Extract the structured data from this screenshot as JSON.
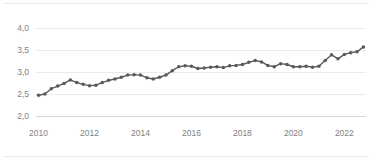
{
  "chart_data": {
    "type": "line",
    "title": "",
    "subtitle": "",
    "xlabel": "",
    "ylabel": "",
    "xlim": [
      2009.9,
      2022.85
    ],
    "ylim": [
      2.0,
      4.0
    ],
    "grid": true,
    "legend": false,
    "legend_position": "none",
    "decimal_separator": ",",
    "marker": "circle",
    "line_color": "#58595b",
    "marker_color": "#58595b",
    "gridline_color": "#e9eaeb",
    "axis_color": "#d8d9da",
    "tick_label_color": "#808285",
    "background_color": "#ffffff",
    "y_ticks": [
      2.0,
      2.5,
      3.0,
      3.5,
      4.0
    ],
    "y_tick_labels": [
      "2,0",
      "2,5",
      "3,0",
      "3,5",
      "4,0"
    ],
    "x_ticks": [
      2010,
      2012,
      2014,
      2016,
      2018,
      2020,
      2022
    ],
    "x_tick_labels": [
      "2010",
      "2012",
      "2014",
      "2016",
      "2018",
      "2020",
      "2022"
    ],
    "frequency": "quarterly",
    "x": [
      2010.0,
      2010.25,
      2010.5,
      2010.75,
      2011.0,
      2011.25,
      2011.5,
      2011.75,
      2012.0,
      2012.25,
      2012.5,
      2012.75,
      2013.0,
      2013.25,
      2013.5,
      2013.75,
      2014.0,
      2014.25,
      2014.5,
      2014.75,
      2015.0,
      2015.25,
      2015.5,
      2015.75,
      2016.0,
      2016.25,
      2016.5,
      2016.75,
      2017.0,
      2017.25,
      2017.5,
      2017.75,
      2018.0,
      2018.25,
      2018.5,
      2018.75,
      2019.0,
      2019.25,
      2019.5,
      2019.75,
      2020.0,
      2020.25,
      2020.5,
      2020.75,
      2021.0,
      2021.25,
      2021.5,
      2021.75,
      2022.0,
      2022.25,
      2022.5,
      2022.75
    ],
    "values": [
      2.47,
      2.5,
      2.62,
      2.68,
      2.74,
      2.82,
      2.76,
      2.72,
      2.69,
      2.7,
      2.76,
      2.81,
      2.84,
      2.88,
      2.93,
      2.94,
      2.93,
      2.87,
      2.84,
      2.88,
      2.93,
      3.03,
      3.12,
      3.14,
      3.13,
      3.08,
      3.09,
      3.11,
      3.12,
      3.1,
      3.14,
      3.15,
      3.17,
      3.22,
      3.26,
      3.23,
      3.15,
      3.12,
      3.19,
      3.17,
      3.12,
      3.12,
      3.13,
      3.11,
      3.13,
      3.26,
      3.39,
      3.3,
      3.4,
      3.44,
      3.46,
      3.57
    ],
    "last_value": 3.5,
    "first_value": 2.47,
    "min_value": 2.47,
    "max_value": 3.57
  }
}
